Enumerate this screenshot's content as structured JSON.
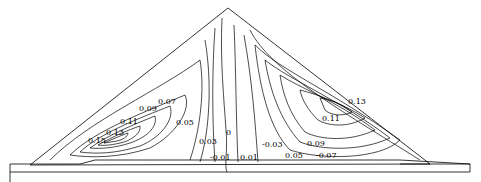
{
  "diagram": {
    "type": "contour-plot",
    "stroke_color": "#000000",
    "background": "#ffffff",
    "left_labels": [
      {
        "id": "l-007",
        "text": "0.07",
        "x": 158,
        "y": 104
      },
      {
        "id": "l-009",
        "text": "0.09",
        "x": 139,
        "y": 111
      },
      {
        "id": "l-011",
        "text": "0.11",
        "x": 120,
        "y": 124
      },
      {
        "id": "l-013",
        "text": "0.13",
        "x": 106,
        "y": 135
      },
      {
        "id": "l-015",
        "text": "0.15",
        "x": 88,
        "y": 143
      },
      {
        "id": "l-005",
        "text": "0.05",
        "x": 176,
        "y": 125
      },
      {
        "id": "l-003",
        "text": "0.03",
        "x": 199,
        "y": 144
      }
    ],
    "center_labels": [
      {
        "id": "c-0",
        "text": "0",
        "x": 226,
        "y": 135
      },
      {
        "id": "c-m001",
        "text": "-0.01",
        "x": 210,
        "y": 160
      },
      {
        "id": "c-001",
        "text": "0.01",
        "x": 240,
        "y": 160
      },
      {
        "id": "c-m003",
        "text": "-0.03",
        "x": 262,
        "y": 147
      }
    ],
    "right_labels": [
      {
        "id": "r-013",
        "text": "0.13",
        "x": 348,
        "y": 104
      },
      {
        "id": "r-011",
        "text": "0.11",
        "x": 322,
        "y": 121
      },
      {
        "id": "r-009",
        "text": "0.09",
        "x": 307,
        "y": 146
      },
      {
        "id": "r-005",
        "text": "0.05",
        "x": 285,
        "y": 158
      },
      {
        "id": "r-m007",
        "text": "-0.07",
        "x": 316,
        "y": 158
      }
    ]
  }
}
